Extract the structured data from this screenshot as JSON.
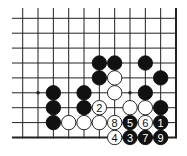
{
  "diagram": {
    "type": "go-board-fragment",
    "grid": {
      "columns": 11,
      "rows": 9,
      "origin_x": 22.7,
      "origin_y": 18.3,
      "spacing_x": 15.33,
      "spacing_y": 14.9,
      "right_edge": true,
      "bottom_edge": true,
      "top_edge": false,
      "left_edge": false
    },
    "hoshi": [
      {
        "col": 1,
        "row": 5
      },
      {
        "col": 7,
        "row": 5
      }
    ],
    "stones": [
      {
        "col": 5,
        "row": 3,
        "color": "black"
      },
      {
        "col": 6,
        "row": 3,
        "color": "black"
      },
      {
        "col": 8,
        "row": 3,
        "color": "black"
      },
      {
        "col": 5,
        "row": 4,
        "color": "black"
      },
      {
        "col": 6,
        "row": 4,
        "color": "white"
      },
      {
        "col": 9,
        "row": 4,
        "color": "black"
      },
      {
        "col": 2,
        "row": 5,
        "color": "black"
      },
      {
        "col": 4,
        "row": 5,
        "color": "black"
      },
      {
        "col": 6,
        "row": 5,
        "color": "white"
      },
      {
        "col": 8,
        "row": 5,
        "color": "black"
      },
      {
        "col": 2,
        "row": 6,
        "color": "black"
      },
      {
        "col": 4,
        "row": 6,
        "color": "black"
      },
      {
        "col": 5,
        "row": 6,
        "color": "white",
        "label": "2"
      },
      {
        "col": 7,
        "row": 6,
        "color": "white"
      },
      {
        "col": 8,
        "row": 6,
        "color": "white"
      },
      {
        "col": 9,
        "row": 6,
        "color": "black"
      },
      {
        "col": 2,
        "row": 7,
        "color": "black"
      },
      {
        "col": 3,
        "row": 7,
        "color": "white"
      },
      {
        "col": 4,
        "row": 7,
        "color": "white"
      },
      {
        "col": 5,
        "row": 7,
        "color": "white"
      },
      {
        "col": 6,
        "row": 7,
        "color": "white",
        "label": "8"
      },
      {
        "col": 7,
        "row": 7,
        "color": "black",
        "label": "5"
      },
      {
        "col": 8,
        "row": 7,
        "color": "white",
        "label": "6"
      },
      {
        "col": 9,
        "row": 7,
        "color": "black",
        "label": "1"
      },
      {
        "col": 6,
        "row": 8,
        "color": "white",
        "label": "4"
      },
      {
        "col": 7,
        "row": 8,
        "color": "black",
        "label": "3"
      },
      {
        "col": 8,
        "row": 8,
        "color": "black",
        "label": "7"
      },
      {
        "col": 9,
        "row": 8,
        "color": "black",
        "label": "9"
      }
    ],
    "colors": {
      "line": "#222222",
      "black_stone": "#111111",
      "white_stone": "#ffffff",
      "background": "#ffffff"
    }
  }
}
